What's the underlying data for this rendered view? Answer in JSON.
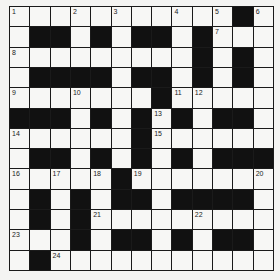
{
  "puzzle": {
    "rows": 13,
    "cols": 13,
    "layout": [
      "WWWWWWWWWWWBW",
      "WBBWBWBBWBWWW",
      "WWWWWWWWWBWBW",
      "WBBBBWBBWBWBW",
      "WWWWWWWBWWWWW",
      "BBBWBWBWBWBBW",
      "WWWWWWBWWWWWW",
      "WBBWBWBWBWBBB",
      "WWWWWBWWWWWWW",
      "WBWBWBBWBBBBW",
      "WBWBWWWWWWWWW",
      "WWWBWBBWBWBBW",
      "WBWWWWWWWWWWW"
    ],
    "numbers": [
      {
        "r": 0,
        "c": 0,
        "n": "1"
      },
      {
        "r": 0,
        "c": 3,
        "n": "2"
      },
      {
        "r": 0,
        "c": 5,
        "n": "3"
      },
      {
        "r": 0,
        "c": 8,
        "n": "4"
      },
      {
        "r": 0,
        "c": 10,
        "n": "5"
      },
      {
        "r": 0,
        "c": 12,
        "n": "6"
      },
      {
        "r": 1,
        "c": 10,
        "n": "7"
      },
      {
        "r": 2,
        "c": 0,
        "n": "8"
      },
      {
        "r": 4,
        "c": 0,
        "n": "9"
      },
      {
        "r": 4,
        "c": 3,
        "n": "10"
      },
      {
        "r": 4,
        "c": 8,
        "n": "11"
      },
      {
        "r": 4,
        "c": 9,
        "n": "12"
      },
      {
        "r": 5,
        "c": 7,
        "n": "13"
      },
      {
        "r": 6,
        "c": 0,
        "n": "14"
      },
      {
        "r": 6,
        "c": 7,
        "n": "15"
      },
      {
        "r": 8,
        "c": 0,
        "n": "16"
      },
      {
        "r": 8,
        "c": 2,
        "n": "17"
      },
      {
        "r": 8,
        "c": 4,
        "n": "18"
      },
      {
        "r": 8,
        "c": 6,
        "n": "19"
      },
      {
        "r": 8,
        "c": 12,
        "n": "20"
      },
      {
        "r": 10,
        "c": 4,
        "n": "21"
      },
      {
        "r": 10,
        "c": 9,
        "n": "22"
      },
      {
        "r": 11,
        "c": 0,
        "n": "23"
      },
      {
        "r": 12,
        "c": 2,
        "n": "24"
      }
    ],
    "colors": {
      "black_cell": "#111111",
      "white_cell": "#f7f7f5",
      "grid_line": "#1a1a1a"
    }
  }
}
